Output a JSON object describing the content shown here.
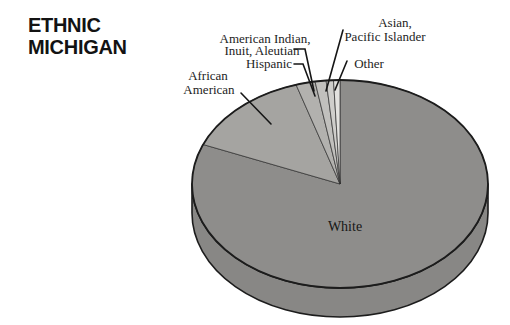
{
  "header": {
    "title_line1": "ETHNIC",
    "title_line2": "MICHIGAN"
  },
  "chart_data": {
    "type": "pie",
    "title": "ETHNIC MICHIGAN",
    "style": "3d-extruded-ellipse, grayscale, no numeric labels shown",
    "start_angle_deg": 90,
    "direction": "counterclockwise",
    "values_unit": "percent (estimated from slice angles)",
    "slices": [
      {
        "label": "Other",
        "value": 0.7,
        "color": "#e3e2df"
      },
      {
        "label": "Asian, Pacific Islander",
        "value": 0.8,
        "color": "#cfcecb"
      },
      {
        "label": "American Indian, Inuit, Aleutian",
        "value": 1.2,
        "color": "#c1c0bd"
      },
      {
        "label": "Hispanic",
        "value": 2.1,
        "color": "#b2b1ae"
      },
      {
        "label": "African American",
        "value": 14.0,
        "color": "#a5a4a1"
      },
      {
        "label": "White",
        "value": 81.2,
        "color": "#8e8d8b"
      }
    ],
    "callouts": {
      "african_american": {
        "line1": "African",
        "line2": "American"
      },
      "hispanic": {
        "line1": "Hispanic"
      },
      "american_indian": {
        "line1": "American Indian,",
        "line2": "Inuit, Aleutian"
      },
      "asian": {
        "line1": "Asian,",
        "line2": "Pacific Islander"
      },
      "other": {
        "line1": "Other"
      },
      "white": {
        "line1": "White"
      }
    },
    "colors": {
      "outline": "#1c1c1c",
      "side_wall": "#888785",
      "background": "#ffffff"
    }
  }
}
